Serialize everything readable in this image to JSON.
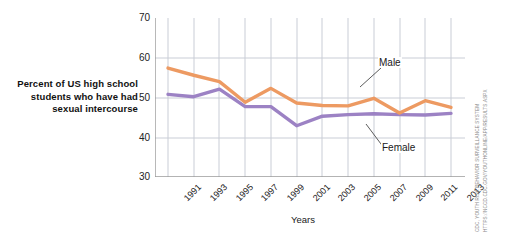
{
  "caption": "Percent of US high school students who have had sexual intercourse",
  "credit": {
    "line1": "CDC, YOUTH RISK BEHAVIOR SURVEILLANCE SYSTEM",
    "line2": "HTTPS://NCCD.CDC.GOV/YOUTHONLINE/APP/RESULTS.ASPX"
  },
  "colors": {
    "male": "#ED9A62",
    "female": "#9C82C4",
    "grid": "#C9CDD6",
    "axis": "#9A9A9A",
    "text": "#222222"
  },
  "chart_data": {
    "type": "line",
    "title": "",
    "xlabel": "Years",
    "ylabel": "",
    "ylim": [
      30,
      70
    ],
    "yticks": [
      30,
      40,
      50,
      60,
      70
    ],
    "grid": true,
    "legend": "inline-annotations",
    "x": [
      1991,
      1992,
      1993,
      1994,
      1995,
      1996,
      1997,
      1998,
      1999,
      2000,
      2001,
      2002,
      2003,
      2004,
      2005,
      2006,
      2007,
      2008,
      2009,
      2010,
      2011,
      2012,
      2013
    ],
    "xtick_labels": [
      "1991",
      "1993",
      "1995",
      "1997",
      "1999",
      "2001",
      "2003",
      "2005",
      "2007",
      "2009",
      "2011",
      "2013"
    ],
    "xticks": [
      1991,
      1993,
      1995,
      1997,
      1999,
      2001,
      2003,
      2005,
      2007,
      2009,
      2011,
      2013
    ],
    "series": [
      {
        "name": "Male",
        "label": "Male",
        "color": "#ED9A62",
        "x": [
          1991,
          1993,
          1995,
          1997,
          1999,
          2001,
          2003,
          2005,
          2007,
          2009,
          2011,
          2013
        ],
        "values": [
          57.4,
          55.6,
          54.0,
          48.8,
          52.3,
          48.6,
          48.0,
          47.9,
          49.8,
          46.1,
          49.2,
          47.5
        ]
      },
      {
        "name": "Female",
        "label": "Female",
        "color": "#9C82C4",
        "x": [
          1991,
          1993,
          1995,
          1997,
          1999,
          2001,
          2003,
          2005,
          2007,
          2009,
          2011,
          2013
        ],
        "values": [
          50.8,
          50.2,
          52.1,
          47.7,
          47.7,
          42.9,
          45.3,
          45.7,
          45.9,
          45.7,
          45.6,
          46.0
        ]
      }
    ],
    "annotations": [
      {
        "text": "Male",
        "x": 2007,
        "y": 54.5
      },
      {
        "text": "Female",
        "x": 2007,
        "y": 38.0
      }
    ]
  }
}
